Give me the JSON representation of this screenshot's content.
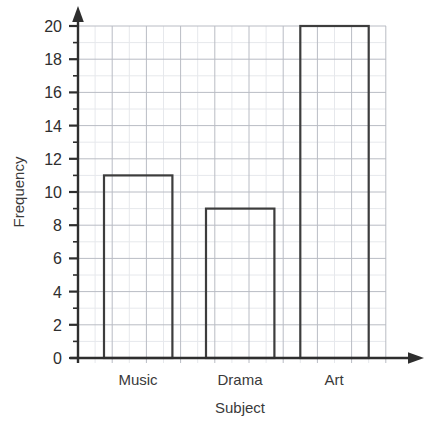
{
  "chart_data": {
    "type": "bar",
    "title": "",
    "subtitle": "",
    "categories": [
      "Music",
      "Drama",
      "Art"
    ],
    "values": [
      11,
      9,
      20
    ],
    "xlabel": "Subject",
    "ylabel": "Frequency",
    "ylim": [
      0,
      20
    ],
    "ytick_step": 2,
    "yticks": [
      0,
      2,
      4,
      6,
      8,
      10,
      12,
      14,
      16,
      18,
      20
    ],
    "ytick_labels": [
      "0",
      "2",
      "4",
      "6",
      "8",
      "10",
      "12",
      "14",
      "16",
      "18",
      "20"
    ],
    "minor_ytick_step": 1,
    "grid": true,
    "grid_major_color": "#b9bcc4",
    "grid_minor_color": "#e4e6ea",
    "legend": false,
    "legend_position": "none",
    "bar_fill": "none",
    "bar_outline_color": "#3d3d3d",
    "axis_color": "#2e2e2e",
    "axis_arrowheads": true,
    "background": "#ffffff",
    "annotations": []
  },
  "axes": {
    "y": {
      "label": "Frequency",
      "ticks": [
        {
          "value": 20,
          "label": "20"
        },
        {
          "value": 18,
          "label": "18"
        },
        {
          "value": 16,
          "label": "16"
        },
        {
          "value": 14,
          "label": "14"
        },
        {
          "value": 12,
          "label": "12"
        },
        {
          "value": 10,
          "label": "10"
        },
        {
          "value": 8,
          "label": "8"
        },
        {
          "value": 6,
          "label": "6"
        },
        {
          "value": 4,
          "label": "4"
        },
        {
          "value": 2,
          "label": "2"
        },
        {
          "value": 0,
          "label": "0"
        }
      ]
    },
    "x": {
      "label": "Subject",
      "categories": [
        {
          "label": "Music",
          "value": 11
        },
        {
          "label": "Drama",
          "value": 9
        },
        {
          "label": "Art",
          "value": 20
        }
      ]
    }
  }
}
